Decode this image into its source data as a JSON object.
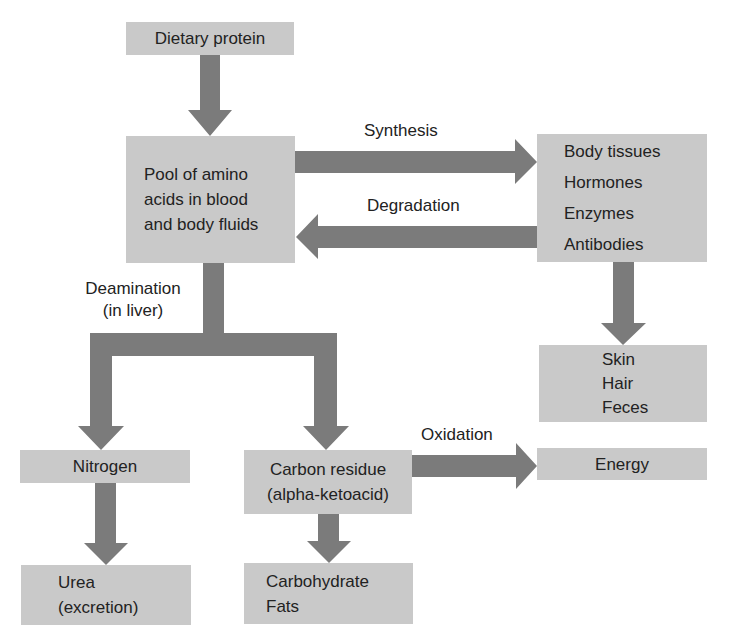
{
  "colors": {
    "box_fill": "#c9c9c9",
    "arrow_fill": "#7b7b7b",
    "text": "#222222",
    "background": "#ffffff"
  },
  "nodes": {
    "dietary_protein": {
      "lines": [
        "Dietary protein"
      ]
    },
    "amino_pool": {
      "lines": [
        "Pool of amino",
        "acids in blood",
        "and body fluids"
      ]
    },
    "body_tissues": {
      "lines": [
        "Body tissues",
        "Hormones",
        "Enzymes",
        "Antibodies"
      ]
    },
    "skin_hair_feces": {
      "lines": [
        "Skin",
        "Hair",
        "Feces"
      ]
    },
    "nitrogen": {
      "lines": [
        "Nitrogen"
      ]
    },
    "carbon_residue": {
      "lines": [
        "Carbon residue",
        "(alpha-ketoacid)"
      ]
    },
    "energy": {
      "lines": [
        "Energy"
      ]
    },
    "urea": {
      "lines": [
        "Urea",
        "(excretion)"
      ]
    },
    "carbohydrate_fats": {
      "lines": [
        "Carbohydrate",
        "Fats"
      ]
    }
  },
  "edge_labels": {
    "synthesis": "Synthesis",
    "degradation": "Degradation",
    "deamination": [
      "Deamination",
      "(in liver)"
    ],
    "oxidation": "Oxidation"
  },
  "edges": [
    {
      "from": "dietary_protein",
      "to": "amino_pool",
      "label": ""
    },
    {
      "from": "amino_pool",
      "to": "body_tissues",
      "label": "Synthesis"
    },
    {
      "from": "body_tissues",
      "to": "amino_pool",
      "label": "Degradation"
    },
    {
      "from": "body_tissues",
      "to": "skin_hair_feces",
      "label": ""
    },
    {
      "from": "amino_pool",
      "to": "nitrogen",
      "label": "Deamination (in liver)"
    },
    {
      "from": "amino_pool",
      "to": "carbon_residue",
      "label": "Deamination (in liver)"
    },
    {
      "from": "nitrogen",
      "to": "urea",
      "label": ""
    },
    {
      "from": "carbon_residue",
      "to": "carbohydrate_fats",
      "label": ""
    },
    {
      "from": "carbon_residue",
      "to": "energy",
      "label": "Oxidation"
    }
  ]
}
